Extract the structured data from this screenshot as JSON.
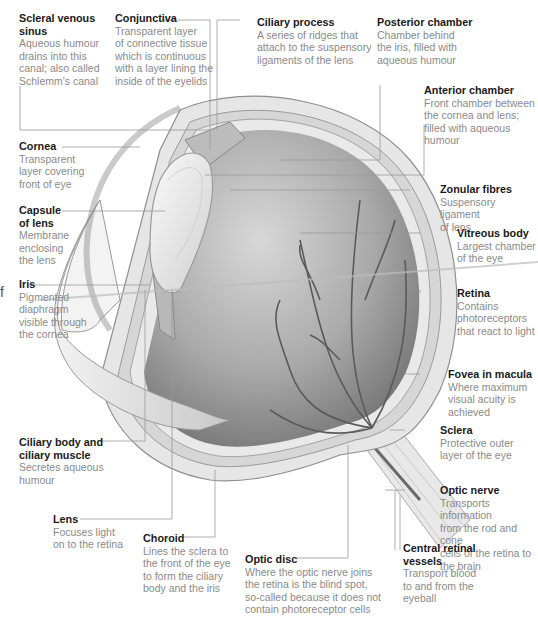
{
  "diagram": {
    "labels": [
      {
        "id": "scleral-venous-sinus",
        "title": "Scleral venous sinus",
        "title_lines": [
          "Scleral venous",
          "sinus"
        ],
        "desc_lines": [
          "Aqueous humour",
          "drains into this",
          "canal; also called",
          "Schlemm's canal"
        ]
      },
      {
        "id": "conjunctiva",
        "title": "Conjunctiva",
        "title_lines": [
          "Conjunctiva"
        ],
        "desc_lines": [
          "Transparent layer",
          "of connective tissue",
          "which is continuous",
          "with a layer lining the",
          "inside of the eyelids"
        ]
      },
      {
        "id": "ciliary-process",
        "title": "Ciliary process",
        "title_lines": [
          "Ciliary process"
        ],
        "desc_lines": [
          "A series of ridges that",
          "attach to the suspensory",
          "ligaments of the lens"
        ]
      },
      {
        "id": "posterior-chamber",
        "title": "Posterior chamber",
        "title_lines": [
          "Posterior chamber"
        ],
        "desc_lines": [
          "Chamber behind",
          "the iris, filled with",
          "aqueous humour"
        ]
      },
      {
        "id": "anterior-chamber",
        "title": "Anterior chamber",
        "title_lines": [
          "Anterior chamber"
        ],
        "desc_lines": [
          "Front chamber between",
          "the cornea and lens;",
          "filled with aqueous",
          "humour"
        ]
      },
      {
        "id": "cornea",
        "title": "Cornea",
        "title_lines": [
          "Cornea"
        ],
        "desc_lines": [
          "Transparent",
          "layer covering",
          "front of eye"
        ]
      },
      {
        "id": "zonular-fibres",
        "title": "Zonular fibres",
        "title_lines": [
          "Zonular fibres"
        ],
        "desc_lines": [
          "Suspensory ligament",
          "of lens"
        ]
      },
      {
        "id": "capsule-of-lens",
        "title": "Capsule of lens",
        "title_lines": [
          "Capsule",
          "of lens"
        ],
        "desc_lines": [
          "Membrane",
          "enclosing",
          "the lens"
        ]
      },
      {
        "id": "vitreous-body",
        "title": "Vitreous body",
        "title_lines": [
          "Vitreous body"
        ],
        "desc_lines": [
          "Largest chamber",
          "of the eye"
        ]
      },
      {
        "id": "iris",
        "title": "Iris",
        "title_lines": [
          "Iris"
        ],
        "desc_lines": [
          "Pigmented",
          "diaphragm",
          "visible through",
          "the cornea"
        ]
      },
      {
        "id": "retina",
        "title": "Retina",
        "title_lines": [
          "Retina"
        ],
        "desc_lines": [
          "Contains",
          "photoreceptors",
          "that react to light"
        ]
      },
      {
        "id": "fovea",
        "title": "Fovea in macula",
        "title_lines": [
          "Fovea in macula"
        ],
        "desc_lines": [
          "Where maximum",
          "visual acuity is",
          "achieved"
        ]
      },
      {
        "id": "ciliary-body",
        "title": "Ciliary body and ciliary muscle",
        "title_lines": [
          "Ciliary body and",
          "ciliary muscle"
        ],
        "desc_lines": [
          "Secretes aqueous",
          "humour"
        ]
      },
      {
        "id": "sclera",
        "title": "Sclera",
        "title_lines": [
          "Sclera"
        ],
        "desc_lines": [
          "Protective outer",
          "layer of the eye"
        ]
      },
      {
        "id": "optic-nerve",
        "title": "Optic nerve",
        "title_lines": [
          "Optic nerve"
        ],
        "desc_lines": [
          "Transports information",
          "from the rod and cone",
          "cells of the retina to",
          "the brain"
        ]
      },
      {
        "id": "lens",
        "title": "Lens",
        "title_lines": [
          "Lens"
        ],
        "desc_lines": [
          "Focuses light",
          "on to the retina"
        ]
      },
      {
        "id": "choroid",
        "title": "Choroid",
        "title_lines": [
          "Choroid"
        ],
        "desc_lines": [
          "Lines the sclera to",
          "the front of the eye",
          "to form the ciliary",
          "body and the iris"
        ]
      },
      {
        "id": "optic-disc",
        "title": "Optic disc",
        "title_lines": [
          "Optic disc"
        ],
        "desc_lines": [
          "Where the optic nerve joins",
          "the retina is the blind spot,",
          "so-called because it does not",
          "contain photoreceptor cells"
        ]
      },
      {
        "id": "central-retinal-vessels",
        "title": "Central retinal vessels",
        "title_lines": [
          "Central retinal",
          "vessels"
        ],
        "desc_lines": [
          "Transport blood",
          "to and from the",
          "eyeball"
        ]
      }
    ],
    "stray_glyph": "f",
    "colors": {
      "title": "#1a1a1a",
      "desc": "#8a8a8a",
      "leader": "#9a9a9a",
      "vitreous": "#8e8e8e",
      "sclera": "#e6e6e6",
      "vessels": "#5a5a5a"
    }
  }
}
